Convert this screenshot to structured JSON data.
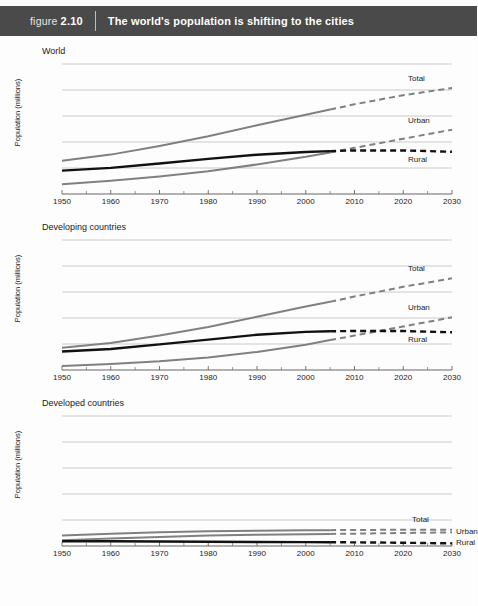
{
  "header": {
    "figure_prefix": "figure",
    "figure_number": "2.10",
    "title": "The world's population is shifting to the cities",
    "bar_color": "#4a4a4a"
  },
  "colors": {
    "total_line": "#808080",
    "urban_line": "#808080",
    "rural_line": "#111111",
    "grid": "#b4b4b4",
    "axis": "#555555",
    "text": "#1a1a1a"
  },
  "chart_data": [
    {
      "type": "line",
      "title": "World",
      "xlabel": "",
      "ylabel": "Population (millions)",
      "xlim": [
        1950,
        2030
      ],
      "ylim": [
        0,
        10
      ],
      "yticks": [
        0,
        2,
        4,
        6,
        8,
        10
      ],
      "xticks": [
        1950,
        1960,
        1970,
        1980,
        1990,
        2000,
        2010,
        2020,
        2030
      ],
      "grid": true,
      "legend": "inline-right-of-series",
      "projection_starts": 2005,
      "x": [
        1950,
        1960,
        1970,
        1980,
        1990,
        2000,
        2005,
        2010,
        2020,
        2030
      ],
      "series": [
        {
          "name": "Total",
          "color": "#808080",
          "values": [
            2.55,
            3.03,
            3.7,
            4.45,
            5.29,
            6.09,
            6.5,
            6.9,
            7.6,
            8.15
          ]
        },
        {
          "name": "Urban",
          "color": "#808080",
          "values": [
            0.75,
            1.02,
            1.35,
            1.75,
            2.27,
            2.86,
            3.2,
            3.55,
            4.25,
            4.95
          ]
        },
        {
          "name": "Rural",
          "color": "#111111",
          "values": [
            1.8,
            2.01,
            2.35,
            2.7,
            3.02,
            3.23,
            3.3,
            3.35,
            3.35,
            3.25
          ]
        }
      ]
    },
    {
      "type": "line",
      "title": "Developing countries",
      "xlabel": "",
      "ylabel": "Population (millions)",
      "xlim": [
        1950,
        2030
      ],
      "ylim": [
        0,
        10
      ],
      "yticks": [
        0,
        2,
        4,
        6,
        8,
        10
      ],
      "xticks": [
        1950,
        1960,
        1970,
        1980,
        1990,
        2000,
        2010,
        2020,
        2030
      ],
      "grid": true,
      "legend": "inline-right-of-series",
      "projection_starts": 2005,
      "x": [
        1950,
        1960,
        1970,
        1980,
        1990,
        2000,
        2005,
        2010,
        2020,
        2030
      ],
      "series": [
        {
          "name": "Total",
          "color": "#808080",
          "values": [
            1.72,
            2.08,
            2.65,
            3.31,
            4.1,
            4.88,
            5.25,
            5.65,
            6.4,
            7.05
          ]
        },
        {
          "name": "Urban",
          "color": "#808080",
          "values": [
            0.3,
            0.46,
            0.67,
            0.97,
            1.39,
            1.95,
            2.3,
            2.65,
            3.35,
            4.05
          ]
        },
        {
          "name": "Rural",
          "color": "#111111",
          "values": [
            1.42,
            1.62,
            1.97,
            2.34,
            2.71,
            2.93,
            2.98,
            3.0,
            3.0,
            2.9
          ]
        }
      ]
    },
    {
      "type": "line",
      "title": "Developed countries",
      "xlabel": "",
      "ylabel": "Population (millions)",
      "xlim": [
        1950,
        2030
      ],
      "ylim": [
        0,
        10
      ],
      "yticks": [
        0,
        2,
        4,
        6,
        8,
        10
      ],
      "xticks": [
        1950,
        1960,
        1970,
        1980,
        1990,
        2000,
        2010,
        2020,
        2030
      ],
      "grid": true,
      "legend": "inline-right-of-series",
      "projection_starts": 2005,
      "x": [
        1950,
        1960,
        1970,
        1980,
        1990,
        2000,
        2005,
        2010,
        2020,
        2030
      ],
      "series": [
        {
          "name": "Total",
          "color": "#808080",
          "values": [
            0.81,
            0.94,
            1.05,
            1.13,
            1.18,
            1.21,
            1.22,
            1.23,
            1.25,
            1.25
          ]
        },
        {
          "name": "Urban",
          "color": "#808080",
          "values": [
            0.44,
            0.57,
            0.7,
            0.8,
            0.87,
            0.91,
            0.93,
            0.95,
            1.0,
            1.05
          ]
        },
        {
          "name": "Rural",
          "color": "#111111",
          "values": [
            0.37,
            0.37,
            0.35,
            0.33,
            0.31,
            0.3,
            0.29,
            0.28,
            0.25,
            0.2
          ]
        }
      ]
    }
  ]
}
